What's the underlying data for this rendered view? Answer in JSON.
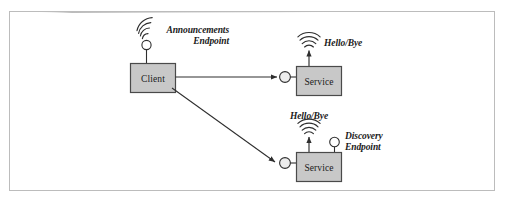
{
  "figure": {
    "type": "network-diagram",
    "background_color": "#ffffff",
    "frame": {
      "border_color": "#b9b9b9",
      "x": 9,
      "y": 11,
      "width": 486,
      "height": 180
    },
    "node_fill_color": "#c8c8c8",
    "node_border_color": "#4a4a4a",
    "line_color": "#3a3a3a"
  },
  "nodes": [
    {
      "id": "client",
      "label": "Client",
      "x": 130,
      "y": 63,
      "width": 46,
      "height": 30
    },
    {
      "id": "service-top",
      "label": "Service",
      "x": 296,
      "y": 66,
      "width": 46,
      "height": 30
    },
    {
      "id": "service-bottom",
      "label": "Service",
      "x": 296,
      "y": 152,
      "width": 46,
      "height": 30
    }
  ],
  "endpoints": [
    {
      "id": "announcements-endpoint",
      "label_line1": "Announcements",
      "label_line2": "Endpoint",
      "icon": "broadcast-wave-icon",
      "circle_x": 146,
      "circle_y": 44,
      "attached_to": "client"
    },
    {
      "id": "discovery-endpoint",
      "label_line1": "Discovery",
      "label_line2": "Endpoint",
      "icon": "endpoint-circle-icon",
      "circle_x": 334,
      "circle_y": 142,
      "attached_to": "service-bottom"
    }
  ],
  "signals": [
    {
      "id": "signal-top",
      "label": "Hello/Bye",
      "icon": "broadcast-wave-icon",
      "attached_to": "service-top"
    },
    {
      "id": "signal-bottom",
      "label": "Hello/Bye",
      "icon": "broadcast-wave-icon",
      "attached_to": "service-bottom"
    }
  ],
  "connections": [
    {
      "id": "client-to-service-top",
      "from": "client",
      "to": "service-top",
      "style": "straight-arrow"
    },
    {
      "id": "client-to-service-bottom",
      "from": "client",
      "to": "service-bottom",
      "style": "diagonal-arrow"
    }
  ],
  "sockets": [
    {
      "id": "socket-top",
      "x": 285,
      "y": 81
    },
    {
      "id": "socket-bottom",
      "x": 285,
      "y": 167
    }
  ]
}
